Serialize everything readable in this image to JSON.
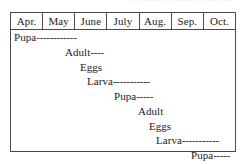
{
  "figure": {
    "top_fragment_text": "••• ••••••• ••• •••••••• ••• •••• •••",
    "months": [
      "Apr.",
      "May",
      "June",
      "July",
      "Aug.",
      "Sep.",
      "Oct."
    ],
    "rows": [
      {
        "stage": "Pupa",
        "dashes": "------------",
        "indent_px": 3,
        "top_px": 2
      },
      {
        "stage": "Adult",
        "dashes": "----",
        "indent_px": 54,
        "top_px": 17
      },
      {
        "stage": "Eggs",
        "dashes": "",
        "indent_px": 69,
        "top_px": 32
      },
      {
        "stage": "Larva",
        "dashes": "-----------",
        "indent_px": 76,
        "top_px": 46
      },
      {
        "stage": "Pupa",
        "dashes": "-----",
        "indent_px": 103,
        "top_px": 61
      },
      {
        "stage": "Adult",
        "dashes": "",
        "indent_px": 127,
        "top_px": 76
      },
      {
        "stage": "Eggs",
        "dashes": "",
        "indent_px": 138,
        "top_px": 91
      },
      {
        "stage": "Larva",
        "dashes": "-----------",
        "indent_px": 145,
        "top_px": 105
      },
      {
        "stage": "Pupa",
        "dashes": "-----",
        "indent_px": 180,
        "top_px": 120
      }
    ]
  },
  "chart_data": {
    "type": "table",
    "title": "",
    "xlabel": "",
    "ylabel": "",
    "categories": [
      "Apr.",
      "May",
      "June",
      "July",
      "Aug.",
      "Sep.",
      "Oct."
    ],
    "series": [
      {
        "name": "Pupa",
        "generation": 1,
        "label": "Pupa------------",
        "start_month": "Apr.",
        "end_month": "June"
      },
      {
        "name": "Adult",
        "generation": 1,
        "label": "Adult----",
        "start_month": "May",
        "end_month": "June"
      },
      {
        "name": "Eggs",
        "generation": 1,
        "label": "Eggs",
        "start_month": "June",
        "end_month": "June"
      },
      {
        "name": "Larva",
        "generation": 1,
        "label": "Larva-----------",
        "start_month": "June",
        "end_month": "Aug."
      },
      {
        "name": "Pupa",
        "generation": 2,
        "label": "Pupa-----",
        "start_month": "July",
        "end_month": "Aug."
      },
      {
        "name": "Adult",
        "generation": 2,
        "label": "Adult",
        "start_month": "Aug.",
        "end_month": "Aug."
      },
      {
        "name": "Eggs",
        "generation": 2,
        "label": "Eggs",
        "start_month": "Aug.",
        "end_month": "Aug."
      },
      {
        "name": "Larva",
        "generation": 2,
        "label": "Larva-----------",
        "start_month": "Aug.",
        "end_month": "Oct."
      },
      {
        "name": "Pupa",
        "generation": 3,
        "label": "Pupa-----",
        "start_month": "Oct.",
        "end_month": "Oct."
      }
    ]
  }
}
